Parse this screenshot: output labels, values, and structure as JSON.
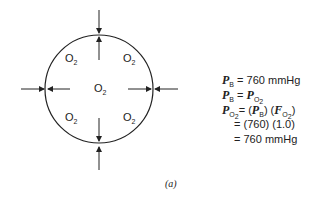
{
  "diagram": {
    "labels": [
      {
        "text": "O",
        "sub": "2",
        "pos": "upper-left"
      },
      {
        "text": "O",
        "sub": "2",
        "pos": "upper-right"
      },
      {
        "text": "O",
        "sub": "2",
        "pos": "center"
      },
      {
        "text": "O",
        "sub": "2",
        "pos": "lower-left"
      },
      {
        "text": "O",
        "sub": "2",
        "pos": "lower-right"
      }
    ],
    "caption": "(a)"
  },
  "equations": [
    {
      "lhs": "P",
      "lhs_sub": "B",
      "rhs": "= 760 mmHg"
    },
    {
      "lhs": "P",
      "lhs_sub": "B",
      "rhs": "= P",
      "rhs_sub": "O2"
    },
    {
      "lhs": "P",
      "lhs_sub": "O2",
      "rhs": "= (P",
      "rhs_mid": "B",
      ")": ") (F",
      "rhs_tail": "O2"
    },
    {
      "rhs": "= (760) (1.0)"
    },
    {
      "rhs": "= 760 mmHg"
    }
  ]
}
